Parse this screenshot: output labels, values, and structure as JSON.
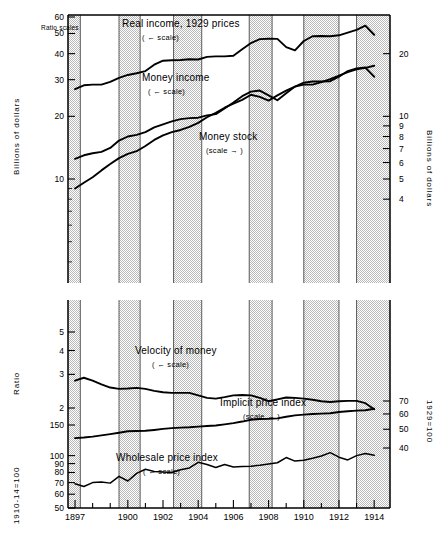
{
  "figure": {
    "note": "Ratio scales",
    "background": "#ffffff",
    "line_color": "#000000",
    "shade_color": "#d9d9d9"
  },
  "axes": {
    "top_panel": {
      "left_title": "Billions of dollars",
      "left_ticks": [
        {
          "value": 60,
          "label": "60"
        },
        {
          "value": 50,
          "label": "50"
        },
        {
          "value": 40,
          "label": "40"
        },
        {
          "value": 30,
          "label": "30"
        },
        {
          "value": 20,
          "label": "20"
        },
        {
          "value": 10,
          "label": "10"
        }
      ],
      "left_minor_ticks": [
        9,
        8,
        7,
        6,
        5,
        4
      ],
      "left_range": [
        3.2,
        65
      ],
      "right_title": "Billions of dollars",
      "right_ticks": [
        {
          "value": 20,
          "label": "20"
        },
        {
          "value": 10,
          "label": "10"
        },
        {
          "value": 9,
          "label": "9"
        },
        {
          "value": 8,
          "label": "8"
        },
        {
          "value": 7,
          "label": "7"
        },
        {
          "value": 6,
          "label": "6"
        },
        {
          "value": 5,
          "label": "5"
        },
        {
          "value": 4,
          "label": "4"
        }
      ],
      "right_range": [
        1.6,
        32.5
      ]
    },
    "bottom_panel": {
      "left_title_ratio": "Ratio",
      "left_ticks_ratio": [
        {
          "value": 5,
          "label": "5"
        },
        {
          "value": 4,
          "label": "4"
        },
        {
          "value": 3,
          "label": "3"
        },
        {
          "value": 2,
          "label": "2"
        }
      ],
      "left_title_index": "1910-14=100",
      "left_ticks_index": [
        {
          "value": 150,
          "label": "150"
        },
        {
          "value": 100,
          "label": "100"
        },
        {
          "value": 90,
          "label": "90"
        },
        {
          "value": 80,
          "label": "80"
        },
        {
          "value": 70,
          "label": "70"
        },
        {
          "value": 60,
          "label": "60"
        },
        {
          "value": 50,
          "label": "50"
        }
      ],
      "right_title": "1929=100",
      "right_ticks": [
        {
          "value": 70,
          "label": "70"
        },
        {
          "value": 60,
          "label": "60"
        },
        {
          "value": 50,
          "label": "50"
        },
        {
          "value": 40,
          "label": "40"
        }
      ]
    },
    "x_ticks": [
      {
        "value": 1897,
        "label": "1897"
      },
      {
        "value": 1898,
        "label": ""
      },
      {
        "value": 1899,
        "label": ""
      },
      {
        "value": 1900,
        "label": "1900"
      },
      {
        "value": 1901,
        "label": ""
      },
      {
        "value": 1902,
        "label": "1902"
      },
      {
        "value": 1903,
        "label": ""
      },
      {
        "value": 1904,
        "label": "1904"
      },
      {
        "value": 1905,
        "label": ""
      },
      {
        "value": 1906,
        "label": "1906"
      },
      {
        "value": 1907,
        "label": ""
      },
      {
        "value": 1908,
        "label": "1908"
      },
      {
        "value": 1909,
        "label": ""
      },
      {
        "value": 1910,
        "label": "1910"
      },
      {
        "value": 1911,
        "label": ""
      },
      {
        "value": 1912,
        "label": "1912"
      },
      {
        "value": 1913,
        "label": ""
      },
      {
        "value": 1914,
        "label": "1914"
      }
    ],
    "x_range": [
      1896.6,
      1914.9
    ]
  },
  "annotations": [
    {
      "id": "real-income",
      "text": "Real income, 1929 prices",
      "scale_note": "( ← scale)",
      "x": 122,
      "y": 18,
      "nx": 142,
      "ny": 33
    },
    {
      "id": "money-income",
      "text": "Money income",
      "scale_note": "( ← scale)",
      "x": 142,
      "y": 72,
      "nx": 148,
      "ny": 87
    },
    {
      "id": "money-stock",
      "text": "Money stock",
      "scale_note": "(scale → )",
      "x": 199,
      "y": 131,
      "nx": 206,
      "ny": 146
    },
    {
      "id": "velocity-of-money",
      "text": "Velocity of money",
      "scale_note": "( ← scale)",
      "x": 135,
      "y": 345,
      "nx": 152,
      "ny": 360
    },
    {
      "id": "implicit-price-index",
      "text": "Implicit price index",
      "scale_note": "(scale → )",
      "x": 220,
      "y": 397,
      "nx": 243,
      "ny": 412
    },
    {
      "id": "wholesale-price-index",
      "text": "Wholesale price index",
      "scale_note": "( ← scale)",
      "x": 116,
      "y": 452,
      "nx": 143,
      "ny": 467
    }
  ],
  "recession_bands": [
    {
      "start": 1896.6,
      "end": 1897.3
    },
    {
      "start": 1899.5,
      "end": 1900.7
    },
    {
      "start": 1902.6,
      "end": 1904.2
    },
    {
      "start": 1906.9,
      "end": 1908.2
    },
    {
      "start": 1910.0,
      "end": 1912.0
    },
    {
      "start": 1913.0,
      "end": 1914.9
    }
  ],
  "chart_data": {
    "type": "line",
    "title": "",
    "xlabel": "",
    "x": [
      1897,
      1897.5,
      1898,
      1898.5,
      1899,
      1899.5,
      1900,
      1900.5,
      1901,
      1901.5,
      1902,
      1902.5,
      1903,
      1903.5,
      1904,
      1904.5,
      1905,
      1905.5,
      1906,
      1906.5,
      1907,
      1907.5,
      1908,
      1908.5,
      1909,
      1909.5,
      1910,
      1910.5,
      1911,
      1911.5,
      1912,
      1912.5,
      1913,
      1913.5,
      1914
    ],
    "series": [
      {
        "name": "Real income, 1929 prices",
        "units": "Billions of dollars",
        "axis": "top-left",
        "values": [
          27.0,
          28.2,
          28.4,
          28.4,
          29.3,
          30.6,
          31.6,
          32.2,
          33.0,
          35.4,
          37.0,
          37.2,
          37.3,
          37.6,
          37.5,
          38.6,
          38.8,
          38.8,
          39.1,
          42.0,
          45.0,
          47.0,
          47.2,
          47.1,
          43.0,
          41.5,
          46.0,
          48.5,
          48.6,
          48.5,
          49.0,
          50.5,
          52.0,
          54.5,
          49.3
        ]
      },
      {
        "name": "Money income",
        "units": "Billions of dollars",
        "axis": "top-left",
        "values": [
          12.5,
          13.0,
          13.3,
          13.5,
          14.1,
          15.3,
          16.0,
          16.3,
          16.8,
          17.7,
          18.3,
          18.9,
          19.4,
          19.6,
          19.7,
          20.2,
          20.5,
          21.8,
          23.3,
          25.0,
          26.3,
          26.6,
          25.2,
          23.9,
          25.8,
          27.8,
          29.0,
          29.4,
          29.4,
          29.5,
          31.0,
          33.0,
          34.0,
          34.3,
          31.0
        ]
      },
      {
        "name": "Money stock",
        "units": "Billions of dollars",
        "axis": "top-right",
        "values": [
          4.5,
          4.8,
          5.1,
          5.5,
          5.9,
          6.3,
          6.6,
          6.8,
          7.2,
          7.7,
          8.1,
          8.4,
          8.6,
          8.9,
          9.3,
          9.9,
          10.4,
          11.0,
          11.5,
          12.0,
          12.7,
          12.4,
          11.9,
          12.6,
          13.3,
          13.9,
          14.2,
          14.2,
          14.6,
          15.1,
          15.7,
          16.3,
          16.8,
          17.1,
          17.5
        ]
      },
      {
        "name": "Velocity of money",
        "units": "Ratio",
        "axis": "bottom-left-ratio",
        "values": [
          2.78,
          2.88,
          2.78,
          2.66,
          2.56,
          2.52,
          2.53,
          2.55,
          2.52,
          2.46,
          2.42,
          2.4,
          2.4,
          2.4,
          2.33,
          2.26,
          2.24,
          2.28,
          2.33,
          2.34,
          2.33,
          2.26,
          2.17,
          2.22,
          2.27,
          2.26,
          2.24,
          2.21,
          2.17,
          2.15,
          2.17,
          2.18,
          2.18,
          2.12,
          1.97
        ]
      },
      {
        "name": "Implicit price index",
        "units": "1929=100",
        "axis": "bottom-right",
        "values": [
          45.0,
          45.3,
          45.8,
          46.5,
          47.2,
          48.0,
          48.8,
          49.0,
          49.1,
          49.6,
          50.2,
          50.7,
          51.0,
          51.2,
          51.6,
          52.0,
          52.3,
          53.0,
          53.8,
          54.8,
          56.0,
          56.5,
          56.6,
          56.9,
          58.0,
          59.0,
          59.5,
          60.0,
          60.2,
          60.5,
          61.4,
          62.0,
          62.4,
          62.7,
          63.8
        ]
      },
      {
        "name": "Wholesale price index",
        "units": "1910-14=100",
        "axis": "bottom-left-index",
        "values": [
          69.0,
          66.5,
          70.0,
          70.5,
          69.5,
          76.0,
          71.5,
          79.0,
          83.5,
          81.0,
          80.5,
          80.0,
          83.0,
          85.0,
          91.5,
          89.0,
          85.5,
          89.0,
          86.0,
          86.5,
          87.0,
          88.0,
          89.5,
          91.0,
          97.5,
          93.0,
          94.0,
          96.5,
          99.5,
          104.0,
          98.0,
          94.5,
          100.0,
          103.0,
          100.5
        ]
      }
    ]
  }
}
